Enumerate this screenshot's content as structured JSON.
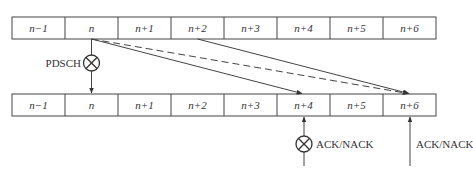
{
  "diagram": {
    "type": "timing-diagram",
    "top_row": {
      "cells": [
        "n−1",
        "n",
        "n+1",
        "n+2",
        "n+3",
        "n+4",
        "n+5",
        "n+6"
      ]
    },
    "bottom_row": {
      "cells": [
        "n−1",
        "n",
        "n+1",
        "n+2",
        "n+3",
        "n+4",
        "n+5",
        "n+6"
      ]
    },
    "labels": {
      "pdsch": "PDSCH",
      "ack_nack_1": "ACK/NACK",
      "ack_nack_2": "ACK/NACK"
    },
    "connections": [
      {
        "from": "top.n",
        "to": "bottom.n",
        "style": "solid",
        "label": "PDSCH",
        "marker": "circle-x"
      },
      {
        "from": "top.n",
        "to": "bottom.n+4",
        "style": "solid"
      },
      {
        "from": "top.n",
        "to": "bottom.n+6",
        "style": "dashed"
      },
      {
        "from": "top.n+2",
        "to": "bottom.n+6",
        "style": "solid"
      },
      {
        "from": "below",
        "to": "bottom.n+4",
        "style": "solid",
        "label": "ACK/NACK",
        "marker": "circle-x"
      },
      {
        "from": "below",
        "to": "bottom.n+6",
        "style": "solid",
        "label": "ACK/NACK"
      }
    ],
    "colors": {
      "line": "#444444",
      "text": "#333333",
      "background": "#ffffff"
    }
  }
}
